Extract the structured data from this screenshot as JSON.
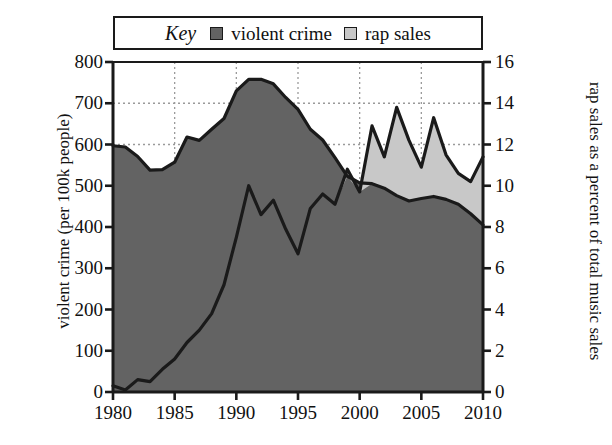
{
  "legend": {
    "key_label": "Key",
    "entries": [
      {
        "label": "violent crime",
        "color": "#636363",
        "swatch_name": "legend-swatch-violent-crime"
      },
      {
        "label": "rap sales",
        "color": "#c8c8c8",
        "swatch_name": "legend-swatch-rap-sales"
      }
    ]
  },
  "axes": {
    "x": {
      "label": "",
      "ticks": [
        "1980",
        "1985",
        "1990",
        "1995",
        "2000",
        "2005",
        "2010"
      ],
      "min": 1980,
      "max": 2010
    },
    "y_left": {
      "label": "violent crime (per 100k people)",
      "ticks": [
        "0",
        "100",
        "200",
        "300",
        "400",
        "500",
        "600",
        "700",
        "800"
      ],
      "min": 0,
      "max": 800
    },
    "y_right": {
      "label": "rap sales as a percent of total music sales",
      "ticks": [
        "0",
        "2",
        "4",
        "6",
        "8",
        "10",
        "12",
        "14",
        "16"
      ],
      "min": 0,
      "max": 16
    }
  },
  "colors": {
    "violent_crime_fill": "#636363",
    "rap_sales_fill": "#c8c8c8",
    "line": "#1a1a1a",
    "grid": "#9a9a9a",
    "background": "#ffffff"
  },
  "chart_data": {
    "type": "area",
    "title": "",
    "xlabel": "",
    "ylabel": "violent crime (per 100k people)",
    "ylabel_right": "rap sales as a percent of total music sales",
    "xlim": [
      1980,
      2010
    ],
    "ylim": [
      0,
      800
    ],
    "ylim_right": [
      0,
      16
    ],
    "grid": true,
    "legend_position": "top",
    "x": [
      1980,
      1981,
      1982,
      1983,
      1984,
      1985,
      1986,
      1987,
      1988,
      1989,
      1990,
      1991,
      1992,
      1993,
      1994,
      1995,
      1996,
      1997,
      1998,
      1999,
      2000,
      2001,
      2002,
      2003,
      2004,
      2005,
      2006,
      2007,
      2008,
      2009,
      2010
    ],
    "series": [
      {
        "name": "violent crime",
        "axis": "left",
        "units": "per 100k people",
        "values": [
          597,
          594,
          571,
          538,
          539,
          557,
          618,
          610,
          637,
          663,
          730,
          758,
          758,
          747,
          714,
          685,
          637,
          611,
          568,
          523,
          507,
          505,
          494,
          476,
          463,
          469,
          474,
          467,
          455,
          432,
          405
        ]
      },
      {
        "name": "rap sales",
        "axis": "right",
        "units": "percent of total music sales",
        "values": [
          0.3,
          0.1,
          0.6,
          0.5,
          1.1,
          1.6,
          2.4,
          3.0,
          3.8,
          5.2,
          7.5,
          10.0,
          8.6,
          9.3,
          7.9,
          6.7,
          8.9,
          9.6,
          9.1,
          10.8,
          9.7,
          12.9,
          11.4,
          13.8,
          12.2,
          10.9,
          13.3,
          11.5,
          10.6,
          10.2,
          11.4
        ]
      }
    ]
  }
}
